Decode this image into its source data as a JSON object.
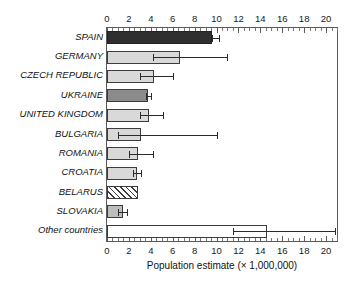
{
  "chart_data": {
    "type": "bar",
    "orientation": "horizontal",
    "title": "",
    "xlabel": "Population estimate (× 1,000,000)",
    "ylabel": "",
    "xlim": [
      0,
      21
    ],
    "xticks": [
      0,
      2,
      4,
      6,
      8,
      10,
      12,
      14,
      16,
      18,
      20
    ],
    "xtick_labels": [
      "0",
      "2",
      "4",
      "6",
      "8",
      "10",
      "12",
      "14",
      "16",
      "18",
      "20"
    ],
    "minor_tick_step": 0.5,
    "grid": false,
    "legend": "none",
    "axis_positions": [
      "top",
      "bottom"
    ],
    "categories": [
      "SPAIN",
      "GERMANY",
      "CZECH REPUBLIC",
      "UKRAINE",
      "UNITED KINGDOM",
      "BULGARIA",
      "ROMANIA",
      "CROATIA",
      "BELARUS",
      "SLOVAKIA",
      "Other countries"
    ],
    "values": [
      9.6,
      6.7,
      4.3,
      3.7,
      3.8,
      3.1,
      2.8,
      2.7,
      2.8,
      1.5,
      14.6
    ],
    "error_low": [
      9.6,
      4.2,
      3.0,
      3.6,
      3.0,
      1.0,
      2.0,
      2.4,
      null,
      1.0,
      11.5
    ],
    "error_high": [
      10.2,
      11.0,
      6.0,
      4.0,
      5.1,
      10.0,
      4.2,
      3.1,
      null,
      1.8,
      20.8
    ],
    "bars": [
      {
        "category": "SPAIN",
        "value": 9.6,
        "fill": "dark",
        "err_low": 9.6,
        "err_high": 10.2
      },
      {
        "category": "GERMANY",
        "value": 6.7,
        "fill": "light",
        "err_low": 4.2,
        "err_high": 11.0
      },
      {
        "category": "CZECH REPUBLIC",
        "value": 4.3,
        "fill": "light",
        "err_low": 3.0,
        "err_high": 6.0
      },
      {
        "category": "UKRAINE",
        "value": 3.7,
        "fill": "mid",
        "err_low": 3.6,
        "err_high": 4.0
      },
      {
        "category": "UNITED KINGDOM",
        "value": 3.8,
        "fill": "light",
        "err_low": 3.0,
        "err_high": 5.1
      },
      {
        "category": "BULGARIA",
        "value": 3.1,
        "fill": "light",
        "err_low": 1.0,
        "err_high": 10.0
      },
      {
        "category": "ROMANIA",
        "value": 2.8,
        "fill": "light",
        "err_low": 2.0,
        "err_high": 4.2
      },
      {
        "category": "CROATIA",
        "value": 2.7,
        "fill": "light",
        "err_low": 2.4,
        "err_high": 3.1
      },
      {
        "category": "BELARUS",
        "value": 2.8,
        "fill": "hatch",
        "err_low": null,
        "err_high": null
      },
      {
        "category": "SLOVAKIA",
        "value": 1.5,
        "fill": "gray",
        "err_low": 1.0,
        "err_high": 1.8
      },
      {
        "category": "Other countries",
        "value": 14.6,
        "fill": "white",
        "err_low": 11.5,
        "err_high": 20.8
      }
    ],
    "colors": {
      "dark": "#2f2f2f",
      "mid": "#8b8b8b",
      "light": "#d9d9d9",
      "gray": "#bdbdbd",
      "white": "#ffffff",
      "hatch": "#ffffff",
      "outline": "#3c3c3c",
      "axis": "#5a5a5a",
      "text": "#111111"
    }
  }
}
